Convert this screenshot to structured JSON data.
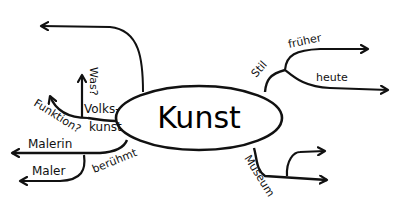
{
  "mindmap": {
    "center": {
      "label": "Kunst"
    },
    "branches": {
      "stil": {
        "label": "Stil",
        "children": [
          {
            "label": "früher"
          },
          {
            "label": "heute"
          }
        ]
      },
      "museum": {
        "label": "Museum",
        "children": [
          {
            "label": ""
          },
          {
            "label": ""
          }
        ]
      },
      "volkskunst": {
        "label_line1": "Volks-",
        "label_line2": "kunst",
        "children": [
          {
            "label": "Was?"
          },
          {
            "label": "Funktion?"
          }
        ]
      },
      "beruehmt": {
        "label": "berühmt",
        "children": [
          {
            "label": "Malerin"
          },
          {
            "label": "Maler"
          }
        ]
      },
      "top_empty": {
        "label": ""
      }
    },
    "colors": {
      "ink": "#111111",
      "background": "#ffffff"
    }
  }
}
